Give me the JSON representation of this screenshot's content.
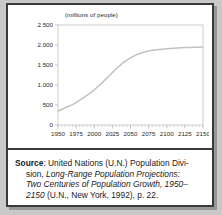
{
  "figure": {
    "chart_title": "(millions of people)",
    "source_label": "Source",
    "source_lines": [
      ": United Nations (U.N.) Population Divi-",
      "sion, ",
      "Long-Range Population Projections:",
      "Two Centuries of Population Growth, 1950–",
      "2150",
      " (U.N., New York, 1992), p. 22."
    ],
    "source_full": "Source: United Nations (U.N.) Population Division, Long-Range Population Projections: Two Centuries of Population Growth, 1950–2150 (U.N., New York, 1992), p. 22."
  },
  "colors": {
    "frame_border": "#3a3a3a",
    "panel_background": "#ffffff",
    "page_background": "#c9c9c9",
    "axis_line": "#b9b9b9",
    "curve_line": "#c2c2c2",
    "tick_label": "#2b2b2b"
  },
  "chart_data": {
    "type": "line",
    "title": "(millions of people)",
    "xlabel": "",
    "ylabel": "(millions of people)",
    "xlim": [
      1950,
      2150
    ],
    "ylim": [
      0,
      2500
    ],
    "grid": false,
    "legend": "none",
    "xticks": [
      1950,
      1975,
      2000,
      2025,
      2050,
      2075,
      2100,
      2125,
      2150
    ],
    "xtick_labels": [
      "1950",
      "1975",
      "2000",
      "2025",
      "2050",
      "2075",
      "2100",
      "2125",
      "2150"
    ],
    "x_minor_tick_interval": 5,
    "yticks": [
      0,
      500,
      1000,
      1500,
      2000,
      2500
    ],
    "ytick_labels": [
      "0",
      "500",
      "1.000",
      "1.500",
      "2.000",
      "2.500"
    ],
    "series": [
      {
        "name": "World population projection",
        "x": [
          1950,
          1960,
          1970,
          1975,
          1980,
          1990,
          2000,
          2010,
          2020,
          2025,
          2030,
          2040,
          2050,
          2060,
          2070,
          2075,
          2080,
          2090,
          2100,
          2110,
          2120,
          2125,
          2130,
          2140,
          2150
        ],
        "values": [
          350,
          430,
          510,
          560,
          620,
          740,
          880,
          1040,
          1220,
          1310,
          1400,
          1560,
          1680,
          1770,
          1830,
          1850,
          1868,
          1890,
          1905,
          1918,
          1930,
          1935,
          1940,
          1945,
          1950
        ]
      }
    ]
  }
}
